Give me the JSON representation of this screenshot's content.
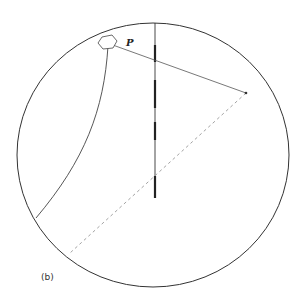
{
  "figure": {
    "panel_label": "(b)",
    "point_label": "P",
    "colors": {
      "stroke": "#333333",
      "thin_stroke": "#555555",
      "dashed": "#999999",
      "background": "#ffffff"
    }
  }
}
